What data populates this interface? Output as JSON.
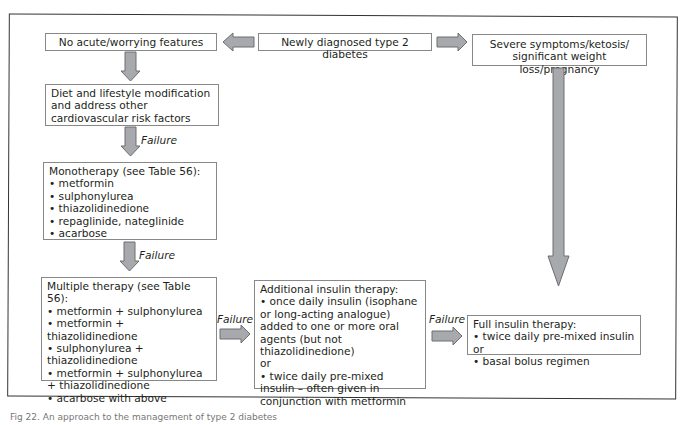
{
  "figure": {
    "caption": "Fig 22. An approach to the management of type 2 diabetes",
    "accent_arrow_fill": "#a7a9ac",
    "accent_arrow_stroke": "#6d6e71"
  },
  "nodes": {
    "start": {
      "label": "Newly diagnosed type 2 diabetes"
    },
    "no_acute": {
      "label": "No acute/worrying features"
    },
    "severe": {
      "label": "Severe symptoms/ketosis/ significant weight loss/pregnancy"
    },
    "diet": {
      "label": "Diet and lifestyle modification and address other cardiovascular risk factors"
    },
    "monotherapy": {
      "title": "Monotherapy (see Table 56):",
      "items": [
        "• metformin",
        "• sulphonylurea",
        "• thiazolidinedione",
        "• repaglinide, nateglinide",
        "• acarbose"
      ]
    },
    "multiple": {
      "title": "Multiple therapy (see Table 56):",
      "items": [
        "• metformin + sulphonylurea",
        "• metformin + thiazolidinedione",
        "• sulphonylurea + thiazolidinedione",
        "• metformin + sulphonylurea + thiazolidinedione",
        "• acarbose with above"
      ]
    },
    "additional_insulin": {
      "title": "Additional insulin therapy:",
      "item1": "• once daily insulin (isophane or long-acting analogue) added to one or more oral agents (but not thiazolidinedione)",
      "or": "or",
      "item2": "• twice daily pre-mixed insulin – often given in conjunction with metformin"
    },
    "full_insulin": {
      "title": "Full insulin therapy:",
      "items": [
        "• twice daily pre-mixed insulin or",
        "• basal bolus regimen"
      ]
    }
  },
  "edges": {
    "failure_label": "Failure"
  }
}
